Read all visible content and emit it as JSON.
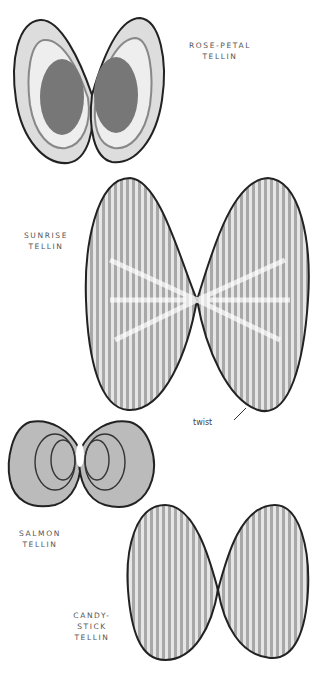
{
  "illustrations": [
    {
      "name": "rose-petal-tellin",
      "label_lines": [
        "ROSE-PETAL",
        "TELLIN"
      ]
    },
    {
      "name": "sunrise-tellin",
      "label_lines": [
        "SUNRISE",
        "TELLIN"
      ],
      "annotation": "twist"
    },
    {
      "name": "salmon-tellin",
      "label_lines": [
        "SALMON",
        "TELLIN"
      ]
    },
    {
      "name": "candy-stick-tellin",
      "label_lines": [
        "CANDY-",
        "STICK",
        "TELLIN"
      ]
    }
  ],
  "colors": {
    "outline": "#222222",
    "shell_light": "#e8e8e8",
    "shell_mid": "#aaaaaa",
    "shell_dark": "#777777"
  }
}
